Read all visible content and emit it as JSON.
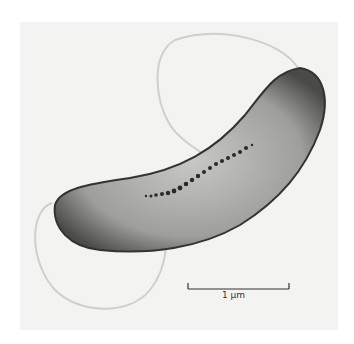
{
  "image": {
    "subject": "curved rod-shaped bacterium with flagella and internal particle chain",
    "scale_bar": {
      "label": "1 μm"
    }
  }
}
